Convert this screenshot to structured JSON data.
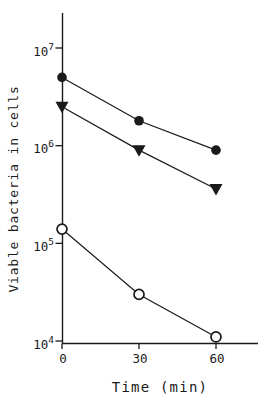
{
  "figure": {
    "background": "#ffffff",
    "ink": "#1a1a1a"
  },
  "chart_data": {
    "type": "line",
    "title": "",
    "xlabel": "Time (min)",
    "ylabel": "Viable bacteria in cells",
    "x_scale": "linear",
    "y_scale": "log",
    "grid": false,
    "legend": "none",
    "x": [
      0,
      30,
      60
    ],
    "x_tick_labels": [
      "0",
      "30",
      "60"
    ],
    "xlim": [
      0,
      76
    ],
    "ylim": [
      10000,
      22000000
    ],
    "y_ticks": [
      {
        "base": "10",
        "exp": "7",
        "value": 10000000
      },
      {
        "base": "10",
        "exp": "6",
        "value": 1000000
      },
      {
        "base": "10",
        "exp": "5",
        "value": 100000
      },
      {
        "base": "10",
        "exp": "4",
        "value": 10000
      }
    ],
    "series": [
      {
        "name": "filled circle",
        "marker": "filled-circle",
        "values": [
          5000000,
          1800000,
          900000
        ]
      },
      {
        "name": "filled triangle",
        "marker": "filled-triangle-down",
        "values": [
          2500000,
          900000,
          360000
        ]
      },
      {
        "name": "open circle",
        "marker": "open-circle",
        "values": [
          140000,
          30000,
          11000
        ]
      }
    ]
  }
}
